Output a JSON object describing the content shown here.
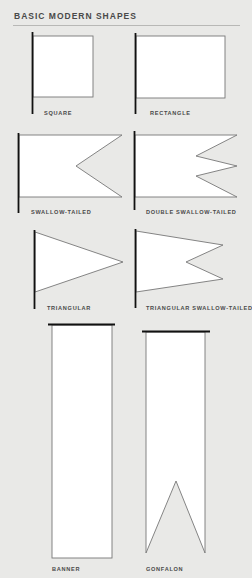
{
  "title": "BASIC MODERN SHAPES",
  "colors": {
    "background": "#e9e9e7",
    "flag_fill": "#ffffff",
    "outline": "#777777",
    "pole": "#111111",
    "text": "#4a4a4a"
  },
  "shapes": [
    {
      "id": "square",
      "label": "SQUARE"
    },
    {
      "id": "rectangle",
      "label": "RECTANGLE"
    },
    {
      "id": "swallow-tailed",
      "label": "SWALLOW-TAILED"
    },
    {
      "id": "double-swallow-tailed",
      "label": "DOUBLE SWALLOW-TAILED"
    },
    {
      "id": "triangular",
      "label": "TRIANGULAR"
    },
    {
      "id": "triangular-swallow-tailed",
      "label": "TRIANGULAR SWALLOW-TAILED"
    },
    {
      "id": "banner",
      "label": "BANNER"
    },
    {
      "id": "gonfalon",
      "label": "GONFALON"
    }
  ]
}
